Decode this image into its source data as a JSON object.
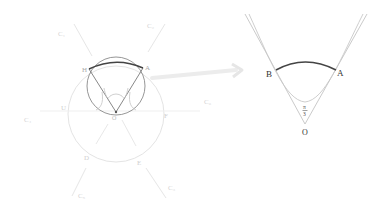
{
  "left_figure": {
    "points": {
      "H": "H",
      "A": "A",
      "O": "O",
      "U": "U",
      "F": "F",
      "D": "D",
      "E": "E"
    },
    "curves": {
      "C1": "C₁",
      "C2": "C₂",
      "C3": "C₃",
      "C4": "C₄",
      "C5": "C₅",
      "C6": "C₆"
    }
  },
  "right_figure": {
    "points": {
      "A": "A",
      "B": "B",
      "O": "O"
    },
    "angle_label": {
      "numerator": "π",
      "denominator": "3"
    }
  },
  "colors": {
    "faint": "#e2e2e2",
    "light": "#c8c8c8",
    "mid": "#9a9a9a",
    "dark": "#555555",
    "arc": "#444444",
    "label_faint": "#d0d0d0",
    "label_dark": "#333333"
  }
}
